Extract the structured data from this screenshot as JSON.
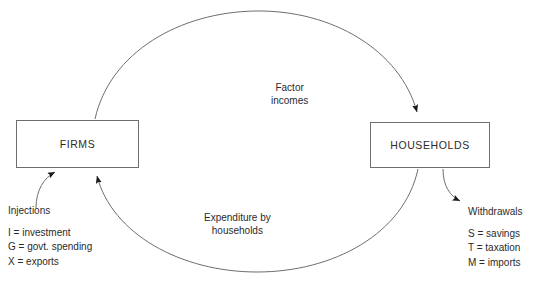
{
  "diagram": {
    "background_color": "#ffffff",
    "line_color": "#6e6e6e",
    "text_color": "#2b2b2b"
  },
  "nodes": {
    "firms": {
      "label": "FIRMS"
    },
    "households": {
      "label": "HOUSEHOLDS"
    }
  },
  "flows": {
    "factor_incomes": {
      "line1": "Factor",
      "line2": "incomes",
      "from": "firms",
      "to": "households",
      "direction": "clockwise-top"
    },
    "expenditure": {
      "line1": "Expenditure by",
      "line2": "households",
      "from": "households",
      "to": "firms",
      "direction": "clockwise-bottom"
    }
  },
  "injections": {
    "title": "Injections",
    "items": [
      "I = investment",
      "G = govt. spending",
      "X = exports"
    ]
  },
  "withdrawals": {
    "title": "Withdrawals",
    "items": [
      "S = savings",
      "T = taxation",
      "M = imports"
    ]
  }
}
